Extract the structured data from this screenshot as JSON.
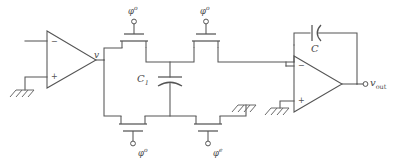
{
  "figure": {
    "kind": "circuit-schematic",
    "stroke_color": "#555555",
    "text_color": "#4a4a4a",
    "background_color": "#ffffff"
  },
  "labels": {
    "node_v": "v",
    "cap_sample": "C",
    "cap_sample_sub": "1",
    "cap_feedback": "C",
    "output": "v",
    "output_sub": "out",
    "phi": "φ",
    "clock_top_left_sup": "o",
    "clock_top_right_sup": "o",
    "clock_bottom_left_sup": "o",
    "clock_bottom_right_sup": "e"
  },
  "opamps": {
    "left": {
      "minus": "−",
      "plus": "+"
    },
    "right": {
      "minus": "−",
      "plus": "+"
    }
  },
  "switches": [
    {
      "id": "sw-top-left",
      "clock": "φ",
      "sup": "o"
    },
    {
      "id": "sw-top-right",
      "clock": "φ",
      "sup": "o"
    },
    {
      "id": "sw-bottom-left",
      "clock": "φ",
      "sup": "o"
    },
    {
      "id": "sw-bottom-right",
      "clock": "φ",
      "sup": "e"
    }
  ],
  "grounds": [
    {
      "id": "gnd-input"
    },
    {
      "id": "gnd-mid"
    },
    {
      "id": "gnd-opamp-right"
    }
  ]
}
